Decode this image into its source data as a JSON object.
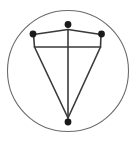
{
  "canvas": {
    "width": 136,
    "height": 144,
    "background_color": "#ffffff"
  },
  "figure": {
    "stroke_color": "#3a3a3a",
    "circle_stroke_color": "#6b6b6b",
    "dot_color": "#1a1a1a",
    "line_width": 1.6,
    "circle_line_width": 1.1,
    "dot_radius": 3.4
  },
  "circle": {
    "label": "enclosing-circle",
    "cx": 68,
    "cy": 71,
    "r": 60.5
  },
  "dots": [
    {
      "label": "top-vertex-dot",
      "cx": 68,
      "cy": 24.5
    },
    {
      "label": "left-vertex-dot",
      "cx": 33,
      "cy": 34
    },
    {
      "label": "right-vertex-dot",
      "cx": 101.5,
      "cy": 34
    },
    {
      "label": "bottom-vertex-dot",
      "cx": 68,
      "cy": 122
    }
  ],
  "lines": [
    {
      "label": "apex-to-left-dot",
      "x1": 68,
      "y1": 29.5,
      "x2": 33.5,
      "y2": 34.5
    },
    {
      "label": "apex-to-right-dot",
      "x1": 68,
      "y1": 29.5,
      "x2": 101,
      "y2": 34.5
    },
    {
      "label": "left-dot-to-left-corner",
      "x1": 33.5,
      "y1": 34.5,
      "x2": 34.5,
      "y2": 47
    },
    {
      "label": "right-dot-to-right-corner",
      "x1": 101,
      "y1": 34.5,
      "x2": 100.5,
      "y2": 47
    },
    {
      "label": "horizontal-crossbar",
      "x1": 34.5,
      "y1": 47,
      "x2": 100.5,
      "y2": 47
    },
    {
      "label": "left-diagonal-to-bottom",
      "x1": 34.5,
      "y1": 47,
      "x2": 68,
      "y2": 118
    },
    {
      "label": "right-diagonal-to-bottom",
      "x1": 100.5,
      "y1": 47,
      "x2": 68,
      "y2": 118
    },
    {
      "label": "vertical-axis",
      "x1": 68,
      "y1": 29.5,
      "x2": 68,
      "y2": 118
    }
  ]
}
